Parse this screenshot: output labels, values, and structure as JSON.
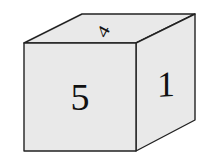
{
  "figure": {
    "type": "cube-net-die",
    "faces": {
      "front": {
        "label": "5"
      },
      "right": {
        "label": "1"
      },
      "top": {
        "label": "4"
      }
    },
    "colors": {
      "face_fill": "#e9e9e9",
      "edge": "#222222",
      "text": "#111111"
    }
  }
}
